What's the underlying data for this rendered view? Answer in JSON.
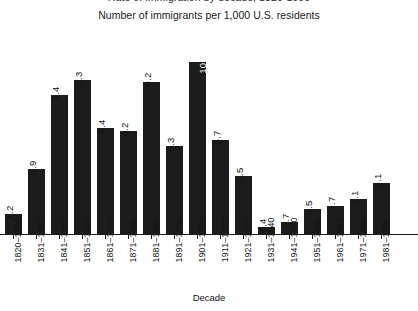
{
  "chart_data": {
    "type": "bar",
    "title": "Rate of immigration by decade, 1820-1990",
    "title_note": "cropped at top edge of screenshot",
    "subtitle": "Number of immigrants per 1,000 U.S. residents",
    "xlabel": "Decade",
    "ylabel": "",
    "ylim": [
      0,
      11
    ],
    "grid": false,
    "legend": false,
    "bar_color": "#1c1c1c",
    "categories": [
      "1820–1830",
      "1831–1840",
      "1841–1850",
      "1851–1860",
      "1861–1870",
      "1871–1880",
      "1881–1890",
      "1891–1900",
      "1901–1910",
      "1911–1920",
      "1921–1930",
      "1931–1940",
      "1941–1950",
      "1951–1960",
      "1961–1970",
      "1971–1980",
      "1981–1990"
    ],
    "values": [
      1.2,
      3.9,
      8.4,
      9.3,
      6.4,
      6.2,
      9.2,
      5.3,
      10.4,
      5.7,
      3.5,
      0.4,
      0.7,
      1.5,
      1.7,
      2.1,
      3.1
    ],
    "value_labels": [
      "1.2",
      "3.9",
      "8.4",
      "9.3",
      "6.4",
      "6.2",
      "9.2",
      "5.3",
      "10.4",
      "5.7",
      "3.5",
      "0.4",
      "0.7",
      "1.5",
      "1.7",
      "2.1",
      "3.1"
    ],
    "label_rotation_deg": 90,
    "label_inside_bar_index": 8,
    "label_inside_color": "#ffffff"
  }
}
